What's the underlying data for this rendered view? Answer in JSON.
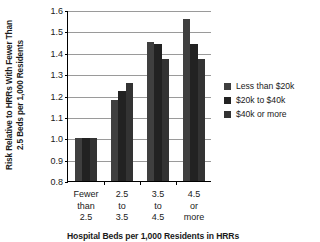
{
  "chart_data": {
    "type": "bar",
    "title": "",
    "xlabel": "Hospital Beds per 1,000 Residents in HRRs",
    "ylabel_lines": [
      "Risk Relative to HRRs With Fewer Than",
      "2.5 Beds per 1,000 Residents"
    ],
    "ylabel": "Risk Relative to HRRs With Fewer Than 2.5 Beds per 1,000 Residents",
    "ylim": [
      0.8,
      1.6
    ],
    "yticks": [
      0.8,
      0.9,
      1.0,
      1.1,
      1.2,
      1.3,
      1.4,
      1.5,
      1.6
    ],
    "ytick_labels": [
      "0.8",
      "0.9",
      "1.0",
      "1.1",
      "1.2",
      "1.3",
      "1.4",
      "1.5",
      "1.6"
    ],
    "grid": true,
    "legend_position": "right",
    "categories": [
      [
        "Fewer",
        "than",
        "2.5"
      ],
      [
        "2.5",
        "to",
        "3.5"
      ],
      [
        "3.5",
        "to",
        "4.5"
      ],
      [
        "4.5",
        "or",
        "more"
      ]
    ],
    "category_labels": [
      "Fewer than 2.5",
      "2.5 to 3.5",
      "3.5 to 4.5",
      "4.5 or more"
    ],
    "series": [
      {
        "name": "Less than $20k",
        "color": "#3f3f3f",
        "values": [
          1.0,
          1.18,
          1.45,
          1.56
        ]
      },
      {
        "name": "$20k to $40k",
        "color": "#222222",
        "values": [
          1.0,
          1.22,
          1.44,
          1.44
        ]
      },
      {
        "name": "$40k or more",
        "color": "#333333",
        "values": [
          1.0,
          1.26,
          1.37,
          1.37
        ]
      }
    ]
  }
}
